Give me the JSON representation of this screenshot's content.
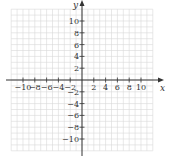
{
  "chart_data": {
    "type": "coordinate-grid",
    "xlabel": "x",
    "ylabel": "y",
    "xlim": [
      -12,
      12
    ],
    "ylim": [
      -12,
      12
    ],
    "grid": true,
    "grid_step": 1,
    "x_ticks": [
      -10,
      -8,
      -6,
      -4,
      -2,
      2,
      4,
      6,
      8,
      10
    ],
    "y_ticks": [
      10,
      8,
      6,
      4,
      2,
      -2,
      -4,
      -6,
      -8,
      -10
    ],
    "x_tick_labels": [
      "−10",
      "−8",
      "−6",
      "−4",
      "−2",
      "2",
      "4",
      "6",
      "8",
      "10"
    ],
    "y_tick_labels": [
      "10",
      "8",
      "6",
      "4",
      "2",
      "−2",
      "−4",
      "−6",
      "−8",
      "−10"
    ],
    "colors": {
      "grid": "#d9d9d9",
      "axis": "#333333"
    }
  }
}
